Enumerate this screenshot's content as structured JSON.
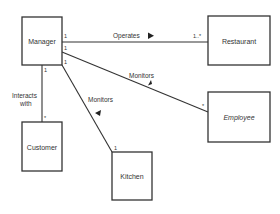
{
  "diagram": {
    "type": "uml-class-diagram",
    "classes": [
      {
        "id": "manager",
        "name": "Manager",
        "abstract": false
      },
      {
        "id": "restaurant",
        "name": "Restaurant",
        "abstract": false
      },
      {
        "id": "employee",
        "name": "Employee",
        "abstract": true
      },
      {
        "id": "customer",
        "name": "Customer",
        "abstract": false
      },
      {
        "id": "kitchen",
        "name": "Kitchen",
        "abstract": false
      }
    ],
    "associations": [
      {
        "id": "operates",
        "label": "Operates",
        "from": "manager",
        "to": "restaurant",
        "from_mult": "1",
        "to_mult": "1..*",
        "direction": "toward restaurant"
      },
      {
        "id": "monitors-employee",
        "label": "Monitors",
        "from": "manager",
        "to": "employee",
        "from_mult": "1",
        "to_mult": "*",
        "direction": "toward manager"
      },
      {
        "id": "monitors-kitchen",
        "label": "Monitors",
        "from": "manager",
        "to": "kitchen",
        "from_mult": "1",
        "to_mult": "1",
        "direction": "toward manager"
      },
      {
        "id": "interacts",
        "label_line1": "Interacts",
        "label_line2": "with",
        "from": "manager",
        "to": "customer",
        "from_mult": "1",
        "to_mult": "*"
      }
    ]
  }
}
